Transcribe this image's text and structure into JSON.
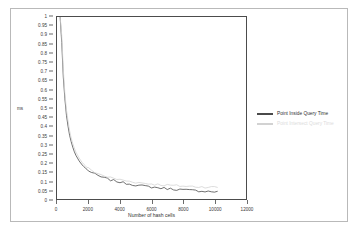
{
  "chart_data": {
    "type": "line",
    "title": "",
    "xlabel": "Number of hash cells",
    "ylabel": "ms",
    "xlim": [
      0,
      12000
    ],
    "ylim": [
      0,
      1
    ],
    "grid": false,
    "legend_position": "right",
    "xticks": [
      "0",
      "2000",
      "4000",
      "6000",
      "8000",
      "10000",
      "12000"
    ],
    "xtick_values": [
      0,
      2000,
      4000,
      6000,
      8000,
      10000,
      12000
    ],
    "yticks": [
      "1",
      "0.95",
      "0.9",
      "0.85",
      "0.8",
      "0.75",
      "0.7",
      "0.65",
      "0.6",
      "0.55",
      "0.5",
      "0.45",
      "0.4",
      "0.35",
      "0.3",
      "0.25",
      "0.2",
      "0.15",
      "0.1",
      "0.05",
      "0"
    ],
    "ytick_values": [
      1,
      0.95,
      0.9,
      0.85,
      0.8,
      0.75,
      0.7,
      0.65,
      0.6,
      0.55,
      0.5,
      0.45,
      0.4,
      0.35,
      0.3,
      0.25,
      0.2,
      0.15,
      0.1,
      0.05,
      0
    ],
    "x": [
      200,
      300,
      400,
      500,
      600,
      700,
      800,
      900,
      1000,
      1100,
      1200,
      1300,
      1400,
      1500,
      1600,
      1700,
      1800,
      1900,
      2000,
      2200,
      2400,
      2600,
      2800,
      3000,
      3200,
      3400,
      3600,
      3800,
      4000,
      4200,
      4400,
      4600,
      4800,
      5000,
      5200,
      5400,
      5600,
      5800,
      6000,
      6200,
      6400,
      6600,
      6800,
      7000,
      7200,
      7400,
      7600,
      7800,
      8000,
      8200,
      8400,
      8600,
      8800,
      9000,
      9200,
      9400,
      9600,
      9800,
      10000,
      10200
    ],
    "series": [
      {
        "name": "Point Inside Query Time",
        "color": "#4a4a4a",
        "values": [
          1.0,
          0.86,
          0.67,
          0.55,
          0.46,
          0.4,
          0.35,
          0.315,
          0.285,
          0.26,
          0.24,
          0.225,
          0.21,
          0.198,
          0.187,
          0.178,
          0.17,
          0.162,
          0.156,
          0.145,
          0.136,
          0.128,
          0.121,
          0.115,
          0.11,
          0.105,
          0.101,
          0.097,
          0.093,
          0.089,
          0.086,
          0.083,
          0.08,
          0.077,
          0.074,
          0.072,
          0.07,
          0.068,
          0.066,
          0.064,
          0.062,
          0.06,
          0.059,
          0.057,
          0.056,
          0.054,
          0.053,
          0.052,
          0.05,
          0.049,
          0.048,
          0.047,
          0.046,
          0.045,
          0.044,
          0.043,
          0.042,
          0.041,
          0.04,
          0.039
        ]
      },
      {
        "name": "Point Intersect Query Time",
        "color": "#d2d2d2",
        "values": [
          1.0,
          0.9,
          0.71,
          0.58,
          0.49,
          0.43,
          0.375,
          0.335,
          0.305,
          0.28,
          0.258,
          0.242,
          0.226,
          0.213,
          0.201,
          0.191,
          0.183,
          0.175,
          0.168,
          0.157,
          0.148,
          0.14,
          0.133,
          0.127,
          0.122,
          0.117,
          0.113,
          0.109,
          0.106,
          0.103,
          0.1,
          0.097,
          0.095,
          0.092,
          0.09,
          0.088,
          0.086,
          0.084,
          0.083,
          0.081,
          0.08,
          0.078,
          0.077,
          0.076,
          0.075,
          0.074,
          0.073,
          0.072,
          0.071,
          0.07,
          0.069,
          0.069,
          0.068,
          0.067,
          0.067,
          0.066,
          0.066,
          0.065,
          0.065,
          0.064
        ]
      }
    ]
  },
  "legend": {
    "entries": [
      {
        "label": "Point Inside Query Time"
      },
      {
        "label": "Point Intersect Query Time"
      }
    ]
  },
  "axis": {
    "y_title": "ms",
    "x_title": "Number of hash cells"
  }
}
